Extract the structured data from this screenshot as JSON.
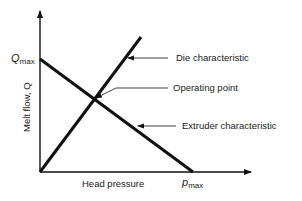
{
  "diagram": {
    "y_axis_label": "Melt flow, Q",
    "x_axis_label": "Head pressure",
    "y_max_symbol": "Q",
    "y_max_sub": "max",
    "x_max_symbol": "p",
    "x_max_sub": "max",
    "annotations": {
      "die": "Die characteristic",
      "operating": "Operating point",
      "extruder": "Extruder characteristic"
    },
    "colors": {
      "line": "#111111",
      "text": "#1a1a1a",
      "background": "#ffffff"
    }
  }
}
